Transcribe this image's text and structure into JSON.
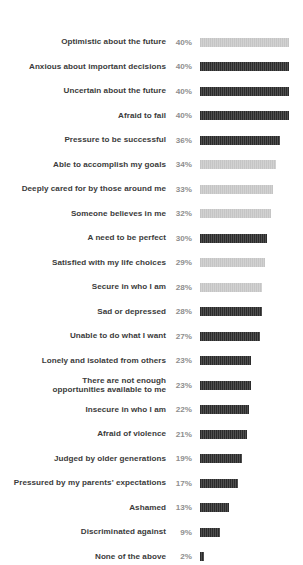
{
  "chart_data": {
    "type": "bar",
    "title": "",
    "subtitle": "",
    "xlabel": "",
    "ylabel": "",
    "orientation": "horizontal",
    "grid": false,
    "legend": false,
    "value_suffix": "%",
    "xlim": [
      0,
      40
    ],
    "colors": {
      "positive_bar": "#c5c5c5",
      "negative_bar": "#2b2b2b",
      "label_text": "#3b3b3b",
      "value_text": "#8e8e8e",
      "background": "#ffffff"
    },
    "categories": [
      "Optimistic about the future",
      "Anxious about important decisions",
      "Uncertain about the future",
      "Afraid to fail",
      "Pressure to be successful",
      "Able to accomplish my goals",
      "Deeply cared for by those around me",
      "Someone believes in me",
      "A need to be perfect",
      "Satisfied with my life choices",
      "Secure in who I am",
      "Sad or depressed",
      "Unable to do what I want",
      "Lonely and isolated from others",
      "There are not enough\nopportunities available to me",
      "Insecure in who I am",
      "Afraid of violence",
      "Judged by older generations",
      "Pressured by my parents' expectations",
      "Ashamed",
      "Discriminated against",
      "None of the above"
    ],
    "values": [
      40,
      40,
      40,
      40,
      36,
      34,
      33,
      32,
      30,
      29,
      28,
      28,
      27,
      23,
      23,
      22,
      21,
      19,
      17,
      13,
      9,
      2
    ],
    "value_labels": [
      "40%",
      "40%",
      "40%",
      "40%",
      "36%",
      "34%",
      "33%",
      "32%",
      "30%",
      "29%",
      "28%",
      "28%",
      "27%",
      "23%",
      "23%",
      "22%",
      "21%",
      "19%",
      "17%",
      "13%",
      "9%",
      "2%"
    ],
    "bar_styles": [
      "light",
      "dark",
      "dark",
      "dark",
      "dark",
      "light",
      "light",
      "light",
      "dark",
      "light",
      "light",
      "dark",
      "dark",
      "dark",
      "dark",
      "dark",
      "dark",
      "dark",
      "dark",
      "dark",
      "dark",
      "dark"
    ]
  }
}
